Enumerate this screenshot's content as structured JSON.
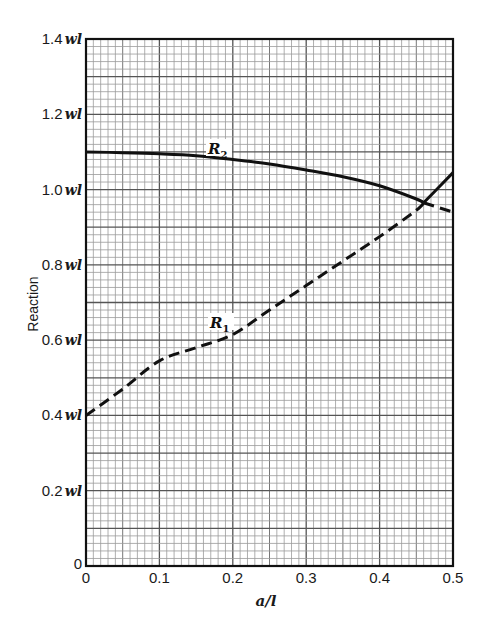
{
  "chart_data": {
    "type": "line",
    "title": "",
    "xlabel": "a/l",
    "ylabel": "Reaction",
    "xlim": [
      0,
      0.5
    ],
    "ylim": [
      0,
      1.4
    ],
    "grid": true,
    "grid_minor_x_step": 0.01,
    "grid_minor_y_step": 0.02,
    "x_ticks": [
      "0",
      "0.1",
      "0.2",
      "0.3",
      "0.4",
      "0.5"
    ],
    "y_ticks": [
      "0",
      "0.2 wl",
      "0.4 wl",
      "0.6 wl",
      "0.8 wl",
      "1.0 wl",
      "1.2 wl",
      "1.4 wl"
    ],
    "x": [
      0,
      0.05,
      0.1,
      0.15,
      0.2,
      0.25,
      0.3,
      0.35,
      0.4,
      0.45,
      0.46,
      0.5
    ],
    "series": [
      {
        "name": "R1",
        "label": "R",
        "subscript": "1",
        "style": "dashed (solid after crossing)",
        "values": [
          0.4,
          0.47,
          0.545,
          0.58,
          0.615,
          0.68,
          0.745,
          0.81,
          0.875,
          0.945,
          0.965,
          1.045
        ]
      },
      {
        "name": "R2",
        "label": "R",
        "subscript": "2",
        "style": "solid (dashed after crossing)",
        "values": [
          1.1,
          1.098,
          1.095,
          1.09,
          1.08,
          1.068,
          1.052,
          1.034,
          1.01,
          0.975,
          0.965,
          0.94
        ]
      }
    ],
    "annotations": [
      {
        "text": "R2",
        "at": [
          0.2,
          1.11
        ]
      },
      {
        "text": "R1",
        "at": [
          0.19,
          0.64
        ]
      }
    ],
    "legend": "none (inline labels)"
  },
  "labels": {
    "y_axis_title": "Reaction",
    "x_axis_title": "a/l",
    "r1_main": "R",
    "r1_sub": "1",
    "r2_main": "R",
    "r2_sub": "2"
  }
}
